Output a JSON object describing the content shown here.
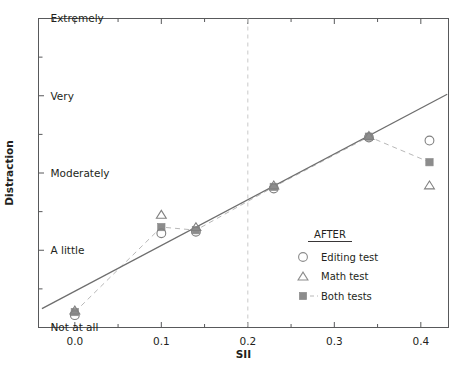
{
  "chart_data": {
    "type": "scatter",
    "title": "",
    "xlabel": "SII",
    "ylabel": "Distraction",
    "xlim": [
      -0.042,
      0.432
    ],
    "ylim": [
      0,
      4
    ],
    "grid": false,
    "xticks": [
      "0.0",
      "0.1",
      "0.2",
      "0.3",
      "0.4"
    ],
    "xtick_values": [
      0.0,
      0.1,
      0.2,
      0.3,
      0.4
    ],
    "yticks": [
      "Not at all",
      "A little",
      "Moderately",
      "Very",
      "Extremely"
    ],
    "ytick_values": [
      0,
      1,
      2,
      3,
      4
    ],
    "annotations": [
      {
        "name": "reference-line",
        "type": "vertical-dashed",
        "x": 0.2,
        "color": "#c9c9c9"
      }
    ],
    "series": [
      {
        "name": "Editing test",
        "marker": "open-circle",
        "color": "#808080",
        "points": [
          {
            "x": 0.0,
            "y": 0.16
          },
          {
            "x": 0.1,
            "y": 1.22
          },
          {
            "x": 0.14,
            "y": 1.24
          },
          {
            "x": 0.23,
            "y": 1.8
          },
          {
            "x": 0.34,
            "y": 2.46
          },
          {
            "x": 0.41,
            "y": 2.42
          }
        ]
      },
      {
        "name": "Math test",
        "marker": "open-triangle",
        "color": "#808080",
        "points": [
          {
            "x": 0.0,
            "y": 0.22
          },
          {
            "x": 0.1,
            "y": 1.46
          },
          {
            "x": 0.14,
            "y": 1.3
          },
          {
            "x": 0.23,
            "y": 1.84
          },
          {
            "x": 0.34,
            "y": 2.48
          },
          {
            "x": 0.41,
            "y": 1.84
          }
        ]
      },
      {
        "name": "Both tests",
        "marker": "filled-square",
        "color": "#8c8c8c",
        "line": "dashed",
        "points": [
          {
            "x": 0.0,
            "y": 0.2
          },
          {
            "x": 0.1,
            "y": 1.3
          },
          {
            "x": 0.14,
            "y": 1.26
          },
          {
            "x": 0.23,
            "y": 1.82
          },
          {
            "x": 0.34,
            "y": 2.47
          },
          {
            "x": 0.41,
            "y": 2.14
          }
        ]
      }
    ],
    "fit_line": {
      "name": "regression-line",
      "style": "solid",
      "color": "#6e6e6e",
      "x_start": -0.038,
      "y_start": 0.245,
      "x_end": 0.4305,
      "y_end": 3.02
    }
  },
  "legend": {
    "title": "AFTER",
    "entries": [
      {
        "label": "Editing test",
        "marker": "open-circle"
      },
      {
        "label": "Math test",
        "marker": "open-triangle"
      },
      {
        "label": "Both tests",
        "marker": "filled-square"
      }
    ]
  },
  "axes": {
    "x_title": "SII",
    "y_title": "Distraction"
  },
  "colors": {
    "frame": "#58595b",
    "marker_gray": "#8c8c8c",
    "line_gray": "#6e6e6e",
    "dashed_gray": "#b8b8b8",
    "reference": "#c9c9c9",
    "text": "#231f20",
    "background": "#ffffff"
  }
}
